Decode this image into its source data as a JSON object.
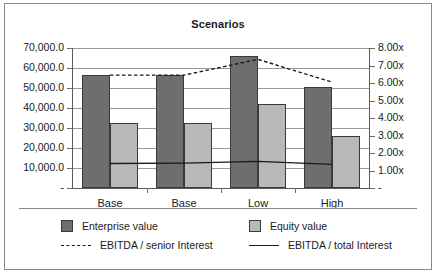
{
  "chart_data": {
    "type": "bar",
    "title": "Scenarios",
    "xlabel": "",
    "categories": [
      "Base",
      "Base",
      "Low",
      "High"
    ],
    "grid": true,
    "legend_position": "bottom",
    "axes": {
      "left": {
        "label": "",
        "ylim": [
          0,
          70000
        ],
        "ticks": [
          0,
          10000,
          20000,
          30000,
          40000,
          50000,
          60000,
          70000
        ],
        "ticklabels": [
          "-",
          "10,000.0",
          "20,000.0",
          "30,000.0",
          "40,000.0",
          "50,000.0",
          "60,000.0",
          "70,000.0"
        ]
      },
      "right": {
        "label": "",
        "ylim": [
          0,
          8
        ],
        "ticks": [
          0,
          1,
          2,
          3,
          4,
          5,
          6,
          7,
          8
        ],
        "ticklabels": [
          "-",
          "1.00x",
          "2.00x",
          "3.00x",
          "4.00x",
          "5.00x",
          "6.00x",
          "7.00x",
          "8.00x"
        ]
      }
    },
    "series": [
      {
        "name": "Enterprise value",
        "kind": "bar",
        "axis": "left",
        "color": "#6e6e6e",
        "values": [
          56300,
          56300,
          66200,
          50400
        ]
      },
      {
        "name": "Equity value",
        "kind": "bar",
        "axis": "left",
        "color": "#b9b9b9",
        "values": [
          32400,
          32400,
          42200,
          26000
        ]
      },
      {
        "name": "EBITDA / senior Interest",
        "kind": "line",
        "style": "dotted",
        "axis": "right",
        "color": "#1a1a1a",
        "values": [
          6.45,
          6.45,
          7.35,
          6.05
        ]
      },
      {
        "name": "EBITDA / total Interest",
        "kind": "line",
        "style": "solid",
        "axis": "right",
        "color": "#1a1a1a",
        "values": [
          1.4,
          1.42,
          1.52,
          1.35
        ]
      }
    ]
  }
}
